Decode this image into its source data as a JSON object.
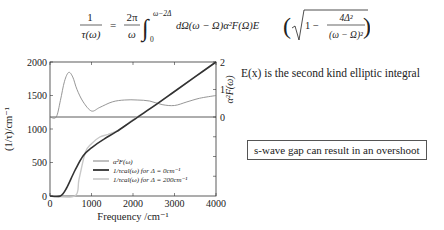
{
  "equation": {
    "lhs_num": "1",
    "lhs_den": "τ(ω)",
    "eq": "=",
    "coef_num": "2π",
    "coef_den": "ω",
    "int_upper": "ω−2Δ",
    "int_lower": "0",
    "integrand": "dΩ(ω − Ω)α²F(Ω)E",
    "sqrt_one": "1 −",
    "frac_num": "4Δ²",
    "frac_den": "(ω − Ω)²"
  },
  "notes": {
    "elliptic": "E(x) is the second kind elliptic integral",
    "overshoot": "s-wave gap can result in an overshoot"
  },
  "colors": {
    "axis": "#333333",
    "a2f": "#8a8a8a",
    "tau0": "#333333",
    "tau200": "#c8c8c8"
  },
  "chart_data": {
    "type": "line",
    "title": "",
    "xlabel": "Frequency /cm⁻¹",
    "ylabel": "(1/τ)/cm⁻¹",
    "ylabel_right": "α²F(ω)",
    "xlim": [
      0,
      4000
    ],
    "ylim": [
      0,
      2000
    ],
    "ylim_right": [
      0,
      2
    ],
    "xticks": [
      "0",
      "1000",
      "2000",
      "3000",
      "4000"
    ],
    "yticks": [
      "0",
      "500",
      "1000",
      "1500",
      "2000"
    ],
    "yticks_right": [
      "0",
      "1",
      "2"
    ],
    "grid": false,
    "legend_position": "lower right inside",
    "legend": [
      "α²F(ω)",
      "1/τcal(ω) for Δ = 0cm⁻¹",
      "1/τcal(ω) for Δ = 200cm⁻¹"
    ],
    "series": [
      {
        "name": "α²F(ω)",
        "axis": "right",
        "x": [
          0,
          150,
          250,
          350,
          450,
          550,
          650,
          800,
          1000,
          1200,
          1500,
          1800,
          2100,
          2400,
          2700,
          3000,
          3300,
          3600,
          4000
        ],
        "values": [
          0,
          0,
          0.6,
          1.3,
          1.62,
          1.45,
          1.0,
          0.55,
          0.22,
          0.35,
          0.55,
          0.62,
          0.62,
          0.58,
          0.45,
          0.42,
          0.55,
          0.68,
          0.78
        ]
      },
      {
        "name": "1/τcal(ω) for Δ = 0cm⁻¹",
        "axis": "left",
        "x": [
          0,
          250,
          400,
          600,
          800,
          1000,
          1300,
          1600,
          2000,
          2500,
          3000,
          3500,
          4000
        ],
        "values": [
          0,
          0,
          120,
          380,
          600,
          720,
          850,
          960,
          1130,
          1340,
          1560,
          1780,
          2000
        ]
      },
      {
        "name": "1/τcal(ω) for Δ = 200cm⁻¹",
        "axis": "left",
        "x": [
          0,
          600,
          700,
          850,
          1000,
          1200,
          1400,
          1700,
          2000,
          2500,
          3000,
          3500,
          4000
        ],
        "values": [
          0,
          0,
          250,
          650,
          780,
          880,
          920,
          1000,
          1140,
          1340,
          1560,
          1780,
          2000
        ]
      }
    ]
  }
}
